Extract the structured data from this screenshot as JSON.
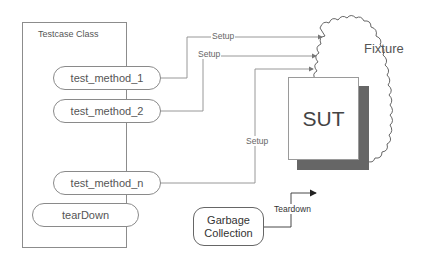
{
  "diagram": {
    "testcase_class": {
      "title": "Testcase Class",
      "methods": [
        {
          "label": "test_method_1"
        },
        {
          "label": "test_method_2"
        },
        {
          "label": "test_method_n"
        }
      ],
      "teardown": "tearDown"
    },
    "connections": {
      "setup_labels": [
        "Setup",
        "Setup",
        "Setup"
      ],
      "teardown_label": "Teardown"
    },
    "fixture": {
      "label": "Fixture",
      "sut_label": "SUT"
    },
    "garbage_collection": {
      "line1": "Garbage",
      "line2": "Collection"
    },
    "colors": {
      "line": "#8c8c8c",
      "sut_shadow": "#666666",
      "arrow_dark": "#222222"
    }
  }
}
